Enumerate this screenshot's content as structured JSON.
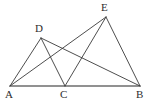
{
  "figure": {
    "background_color": "#ffffff",
    "stroke_color": "#3a3a3a",
    "baseline_color": "#6e6e6e",
    "label_color": "#2e2e2e",
    "width": 159,
    "height": 105,
    "points": [
      {
        "id": "A",
        "label": "A",
        "x": 10,
        "y": 86,
        "label_x": 5,
        "label_y": 89
      },
      {
        "id": "C",
        "label": "C",
        "x": 65,
        "y": 86,
        "label_x": 60,
        "label_y": 89
      },
      {
        "id": "B",
        "label": "B",
        "x": 140,
        "y": 86,
        "label_x": 136,
        "label_y": 89
      },
      {
        "id": "D",
        "label": "D",
        "x": 41,
        "y": 38,
        "label_x": 35,
        "label_y": 23
      },
      {
        "id": "E",
        "label": "E",
        "x": 106,
        "y": 17,
        "label_x": 101,
        "label_y": 2
      }
    ],
    "segments": [
      {
        "id": "AB",
        "from": "A",
        "to": "B",
        "style": "baseline"
      },
      {
        "id": "DA",
        "from": "D",
        "to": "A",
        "style": "normal"
      },
      {
        "id": "DC",
        "from": "D",
        "to": "C",
        "style": "normal"
      },
      {
        "id": "DB",
        "from": "D",
        "to": "B",
        "style": "normal"
      },
      {
        "id": "EA",
        "from": "E",
        "to": "A",
        "style": "normal"
      },
      {
        "id": "EC",
        "from": "E",
        "to": "C",
        "style": "normal"
      },
      {
        "id": "EB",
        "from": "E",
        "to": "B",
        "style": "normal"
      }
    ]
  }
}
